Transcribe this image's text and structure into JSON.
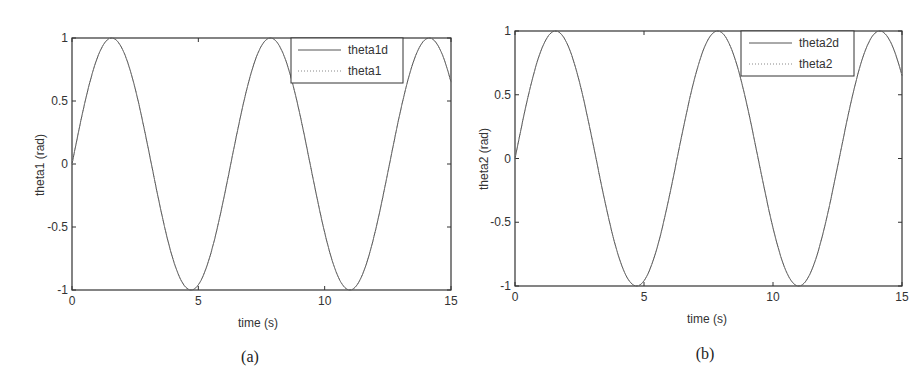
{
  "chart_data": [
    {
      "type": "line",
      "panel": "(a)",
      "xlabel": "time (s)",
      "ylabel": "theta1 (rad)",
      "xlim": [
        0,
        15
      ],
      "ylim": [
        -1,
        1
      ],
      "xticks": [
        0,
        5,
        10,
        15
      ],
      "xtick_labels": [
        "0",
        "5",
        "10",
        "15"
      ],
      "yticks": [
        -1,
        -0.5,
        0,
        0.5,
        1
      ],
      "ytick_labels": [
        "-1",
        "-0.5",
        "0",
        "0.5",
        "1"
      ],
      "grid": false,
      "legend_position": "upper right",
      "series": [
        {
          "name": "theta1d",
          "style": "solid",
          "function": "sin(t)",
          "color": "#555555",
          "x": [
            0,
            1.571,
            3.142,
            4.712,
            6.283,
            7.854,
            9.425,
            10.996,
            12.566,
            14.137,
            15
          ],
          "values": [
            0,
            1,
            0,
            -1,
            0,
            1,
            0,
            -1,
            0,
            1,
            0.65
          ]
        },
        {
          "name": "theta1",
          "style": "dotted",
          "function": "sin(t)",
          "color": "#555555",
          "x": [
            0,
            1.571,
            3.142,
            4.712,
            6.283,
            7.854,
            9.425,
            10.996,
            12.566,
            14.137,
            15
          ],
          "values": [
            0,
            1,
            0,
            -1,
            0,
            1,
            0,
            -1,
            0,
            1,
            0.65
          ]
        }
      ]
    },
    {
      "type": "line",
      "panel": "(b)",
      "xlabel": "time (s)",
      "ylabel": "theta2 (rad)",
      "xlim": [
        0,
        15
      ],
      "ylim": [
        -1,
        1
      ],
      "xticks": [
        0,
        5,
        10,
        15
      ],
      "xtick_labels": [
        "0",
        "5",
        "10",
        "15"
      ],
      "yticks": [
        -1,
        -0.5,
        0,
        0.5,
        1
      ],
      "ytick_labels": [
        "-1",
        "-0.5",
        "0",
        "0.5",
        "1"
      ],
      "grid": false,
      "legend_position": "upper right",
      "series": [
        {
          "name": "theta2d",
          "style": "solid",
          "function": "sin(t)",
          "color": "#555555",
          "x": [
            0,
            1.571,
            3.142,
            4.712,
            6.283,
            7.854,
            9.425,
            10.996,
            12.566,
            14.137,
            15
          ],
          "values": [
            0,
            1,
            0,
            -1,
            0,
            1,
            0,
            -1,
            0,
            1,
            0.65
          ]
        },
        {
          "name": "theta2",
          "style": "dotted",
          "function": "sin(t)",
          "color": "#555555",
          "x": [
            0,
            1.571,
            3.142,
            4.712,
            6.283,
            7.854,
            9.425,
            10.996,
            12.566,
            14.137,
            15
          ],
          "values": [
            0,
            1,
            0,
            -1,
            0,
            1,
            0,
            -1,
            0,
            1,
            0.65
          ]
        }
      ]
    }
  ],
  "panels": [
    {
      "caption": "(a)",
      "xlabel": "time (s)",
      "ylabel": "theta1 (rad)",
      "legend": [
        "theta1d",
        "theta1"
      ]
    },
    {
      "caption": "(b)",
      "xlabel": "time (s)",
      "ylabel": "theta2 (rad)",
      "legend": [
        "theta2d",
        "theta2"
      ]
    }
  ],
  "colors": {
    "axis": "#333333",
    "line": "#555555",
    "background": "#ffffff"
  }
}
